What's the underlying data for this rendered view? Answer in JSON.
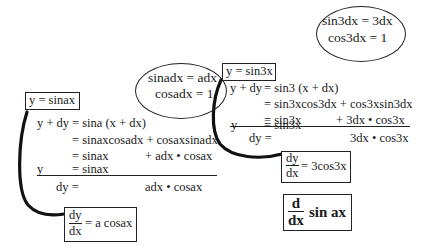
{
  "left_derivation": {
    "function_box": "y = sinax",
    "identity_ellipse": {
      "line1": "sinadx = adx",
      "line2": "cosadx = 1"
    },
    "lines": [
      {
        "lhs": "y + dy",
        "rhs": "= sina (x + dx)"
      },
      {
        "lhs": "",
        "rhs": "= sinaxcosadx + cosaxsinadx"
      },
      {
        "lhs": "",
        "rhs_a": "= sinax",
        "rhs_b": "+ adx • cosax"
      },
      {
        "lhs": "y",
        "rhs_a": "= sinax"
      },
      {
        "lhs": "dy =",
        "rhs_b": "adx • cosax"
      }
    ],
    "result_box": {
      "numerator": "dy",
      "denominator": "dx",
      "rhs": "= a cosax"
    }
  },
  "right_derivation": {
    "function_box": "y = sin3x",
    "identity_ellipse": {
      "line1": "sin3dx = 3dx",
      "line2": "cos3dx = 1"
    },
    "lines": [
      {
        "lhs": "y + dy",
        "rhs": "= sin3 (x + dx)"
      },
      {
        "lhs": "",
        "rhs": "= sin3xcos3dx + cos3xsin3dx"
      },
      {
        "lhs": "",
        "rhs_a": "= sin3x",
        "rhs_b": "+ 3dx • cos3x"
      },
      {
        "lhs": "y",
        "rhs_a": "= sin3x"
      },
      {
        "lhs": "dy =",
        "rhs_b": "3dx • cos3x"
      }
    ],
    "result_box": {
      "numerator": "dy",
      "denominator": "dx",
      "rhs": "= 3cos3x"
    }
  },
  "title_box": {
    "numerator": "d",
    "denominator": "dx",
    "expression": "sin ax"
  }
}
